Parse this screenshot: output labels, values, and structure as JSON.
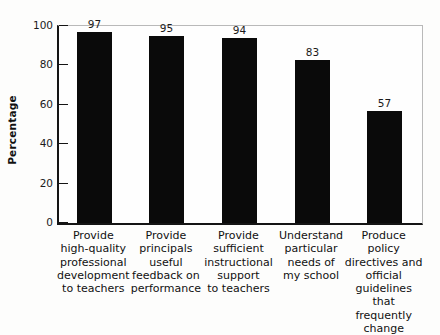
{
  "chart_data": {
    "type": "bar",
    "title": "",
    "xlabel": "",
    "ylabel": "Percentage",
    "ylim": [
      0,
      100
    ],
    "ytick_values": [
      0,
      20,
      40,
      60,
      80,
      100
    ],
    "ytick_labels": [
      "0",
      "20",
      "40",
      "60",
      "80",
      "100"
    ],
    "grid": false,
    "legend": null,
    "bar_color": "#0a0a0a",
    "axis_color": "#141414",
    "categories": [
      "Provide high-quality professional development to teachers",
      "Provide principals useful feedback on performance",
      "Provide sufficient instructional support to teachers",
      "Understand particular needs of my school",
      "Produce policy directives and official guidelines that frequently change"
    ],
    "category_lines": [
      [
        "Provide",
        "high-quality",
        "professional",
        "development",
        "to teachers"
      ],
      [
        "Provide",
        "principals",
        "useful",
        "feedback on",
        "performance"
      ],
      [
        "Provide",
        "sufficient",
        "instructional",
        "support",
        "to teachers"
      ],
      [
        "Understand",
        "particular",
        "needs of",
        "my school"
      ],
      [
        "Produce policy",
        "directives and",
        "official",
        "guidelines",
        "that frequently",
        "change"
      ]
    ],
    "values": [
      97,
      95,
      94,
      83,
      57
    ],
    "value_labels": [
      "97",
      "95",
      "94",
      "83",
      "57"
    ]
  }
}
